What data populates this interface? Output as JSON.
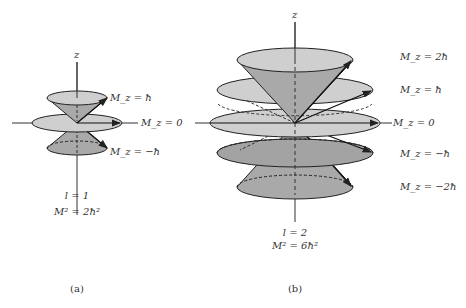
{
  "figure_a": {
    "axis_label": "z",
    "labels": {
      "mz_plus1": "M_z = ħ",
      "mz_0": "M_z = 0",
      "mz_minus1": "M_z = −ħ"
    },
    "l_value": "l = 1",
    "m_squared": "M² = 2ħ²",
    "caption": "(a)"
  },
  "figure_b": {
    "axis_label": "z",
    "labels": {
      "mz_plus2": "M_z = 2ħ",
      "mz_plus1": "M_z = ħ",
      "mz_0": "M_z = 0",
      "mz_minus1": "M_z = −ħ",
      "mz_minus2": "M_z = −2ħ"
    },
    "l_value": "l = 2",
    "m_squared": "M² = 6ħ²",
    "caption": "(b)"
  },
  "colors": {
    "disk_fill": "#cfcfcf",
    "cone_fill": "#a9a9a9",
    "stroke": "#222222"
  }
}
